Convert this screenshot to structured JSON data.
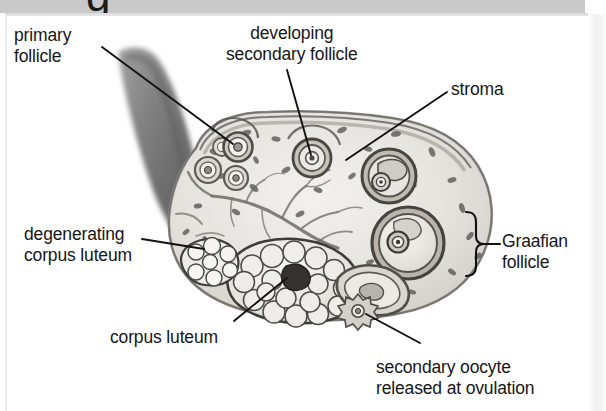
{
  "page": {
    "background_color": "#ffffff",
    "band_color": "#c9c9c9",
    "clipped_header_glyph": "g"
  },
  "figure": {
    "line_color": "#111111",
    "text_color": "#161616"
  },
  "labels": [
    {
      "id": "primary-follicle",
      "text": "primary\nfollicle",
      "x": 14,
      "y": 25,
      "align": "left"
    },
    {
      "id": "developing-secondary",
      "text": "developing\nsecondary follicle",
      "x": 226,
      "y": 23,
      "align": "center"
    },
    {
      "id": "stroma",
      "text": "stroma",
      "x": 451,
      "y": 79,
      "align": "left"
    },
    {
      "id": "degenerating-cl",
      "text": "degenerating\ncorpus luteum",
      "x": 24,
      "y": 224,
      "align": "left"
    },
    {
      "id": "graafian-follicle",
      "text": "Graafian\nfollicle",
      "x": 502,
      "y": 231,
      "align": "left"
    },
    {
      "id": "corpus-luteum",
      "text": "corpus luteum",
      "x": 110,
      "y": 327,
      "align": "left"
    },
    {
      "id": "secondary-oocyte",
      "text": "secondary oocyte\nreleased at ovulation",
      "x": 376,
      "y": 357,
      "align": "left"
    }
  ],
  "structures": [
    {
      "id": "ligament",
      "name": "suspensory ligament / mesovarium"
    },
    {
      "id": "ovary-body",
      "name": "ovary cortex and medulla"
    },
    {
      "id": "germinal-epithelium",
      "name": "germinal epithelium outer layer"
    },
    {
      "id": "primordial-follicles",
      "name": "primordial follicles"
    },
    {
      "id": "primary-follicle",
      "name": "primary follicle"
    },
    {
      "id": "secondary-follicle",
      "name": "developing secondary follicle"
    },
    {
      "id": "graafian-follicle-1",
      "name": "Graafian follicle upper"
    },
    {
      "id": "graafian-follicle-2",
      "name": "Graafian follicle lower"
    },
    {
      "id": "corpus-luteum",
      "name": "corpus luteum"
    },
    {
      "id": "corpus-albicans",
      "name": "degenerating corpus luteum"
    },
    {
      "id": "ruptured-follicle",
      "name": "ruptured follicle"
    },
    {
      "id": "secondary-oocyte",
      "name": "secondary oocyte"
    },
    {
      "id": "blood-vessels",
      "name": "stromal blood vessels"
    }
  ]
}
